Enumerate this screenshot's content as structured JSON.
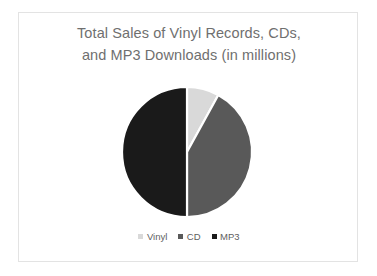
{
  "slide": {
    "background_color": "#ffffff",
    "frame_color": "#e3e3e3"
  },
  "chart_data": {
    "type": "pie",
    "title": "Total Sales of Vinyl Records, CDs, and MP3 Downloads (in millions)",
    "title_line_1": "Total Sales of Vinyl Records, CDs,",
    "title_line_2": "and MP3 Downloads (in millions)",
    "title_color": "#6f6f6f",
    "xlabel": "",
    "ylabel": "",
    "categories": [
      "Vinyl",
      "CD",
      "MP3"
    ],
    "values": [
      8,
      42,
      50
    ],
    "units": "millions",
    "percentages": [
      8,
      42,
      50
    ],
    "colors": [
      "#d9d9d9",
      "#595959",
      "#1a1a1a"
    ],
    "slice_separator_color": "#ffffff",
    "start_angle_deg": 0,
    "direction": "clockwise",
    "grid": false,
    "legend_position": "bottom",
    "legend": [
      {
        "label": "Vinyl",
        "color": "#d9d9d9",
        "value": 8
      },
      {
        "label": "CD",
        "color": "#595959",
        "value": 42
      },
      {
        "label": "MP3",
        "color": "#1a1a1a",
        "value": 50
      }
    ],
    "geometry": {
      "center_x": 187,
      "center_y": 152,
      "radius": 65
    }
  }
}
